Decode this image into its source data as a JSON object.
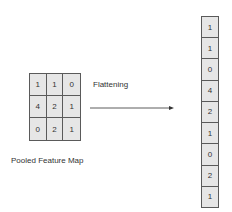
{
  "pooled_map": {
    "label": "Pooled Feature Map",
    "rows": [
      [
        "1",
        "1",
        "0"
      ],
      [
        "4",
        "2",
        "1"
      ],
      [
        "0",
        "2",
        "1"
      ]
    ]
  },
  "operation": {
    "label": "Flattening"
  },
  "flattened": {
    "values": [
      "1",
      "1",
      "0",
      "4",
      "2",
      "1",
      "0",
      "2",
      "1"
    ]
  },
  "colors": {
    "cell_fill": "#e6e6e6",
    "border": "#5a5a5a",
    "text": "#333333"
  }
}
